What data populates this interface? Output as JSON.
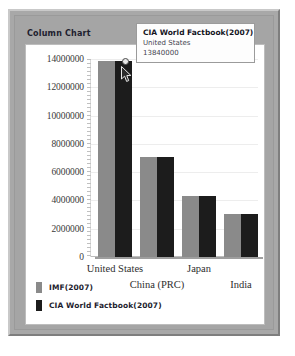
{
  "window": {
    "title": "Column Chart"
  },
  "tooltip": {
    "series": "CIA World Factbook(2007)",
    "category": "United States",
    "value": "13840000"
  },
  "legend": {
    "items": [
      {
        "label": "IMF(2007)",
        "color": "#8a8a8a",
        "swatch_name": "legend-swatch-imf"
      },
      {
        "label": "CIA World Factbook(2007)",
        "color": "#1c1c1c",
        "swatch_name": "legend-swatch-cia"
      }
    ]
  },
  "chart_data": {
    "type": "bar",
    "title": "Column Chart",
    "xlabel": "",
    "ylabel": "",
    "categories": [
      "United States",
      "China (PRC)",
      "Japan",
      "India"
    ],
    "series": [
      {
        "name": "IMF(2007)",
        "color": "#8a8a8a",
        "values": [
          13840000,
          7100000,
          4340000,
          3050000
        ]
      },
      {
        "name": "CIA World Factbook(2007)",
        "color": "#1c1c1c",
        "values": [
          13840000,
          7100000,
          4340000,
          3050000
        ]
      }
    ],
    "ylim": [
      0,
      14000000
    ],
    "ytick_labels": [
      "14000000",
      "12000000",
      "10000000",
      "8000000",
      "6000000",
      "4000000",
      "2000000",
      "0"
    ],
    "ytick_values": [
      14000000,
      12000000,
      10000000,
      8000000,
      6000000,
      4000000,
      2000000,
      0
    ],
    "grid": true,
    "legend_position": "bottom-left",
    "highlighted_point": {
      "series": "CIA World Factbook(2007)",
      "category": "United States",
      "value": 13840000
    }
  }
}
